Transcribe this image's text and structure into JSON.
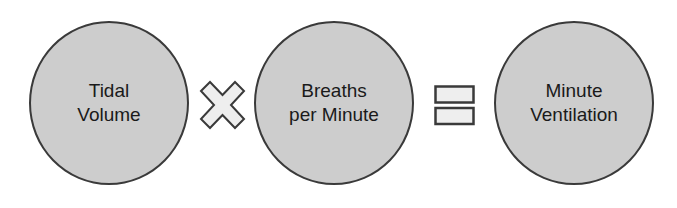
{
  "diagram": {
    "nodes": [
      {
        "id": "tidal-volume",
        "label": "Tidal\nVolume"
      },
      {
        "id": "breaths-per-minute",
        "label": "Breaths\nper Minute"
      },
      {
        "id": "minute-ventilation",
        "label": "Minute\nVentilation"
      }
    ],
    "operators": [
      {
        "symbol": "multiply-icon",
        "between": [
          "tidal-volume",
          "breaths-per-minute"
        ]
      },
      {
        "symbol": "equals-icon",
        "between": [
          "breaths-per-minute",
          "minute-ventilation"
        ]
      }
    ],
    "colors": {
      "circle_fill": "#cdcdcd",
      "circle_stroke": "#3a3a3a",
      "operator_fill": "#eeeeee",
      "text": "#1a1a1a"
    }
  }
}
